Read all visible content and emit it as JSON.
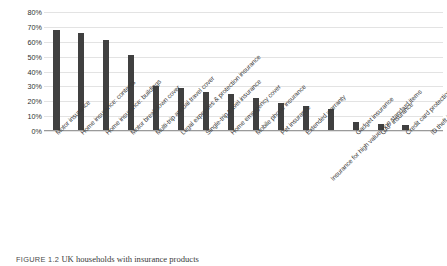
{
  "caption": {
    "number": "FIGURE 1.2",
    "text": "UK households with insurance products"
  },
  "chart_data": {
    "type": "bar",
    "title": "",
    "xlabel": "",
    "ylabel": "Percentage of UK households",
    "ylim": [
      0,
      80
    ],
    "ytick_labels": [
      "0%",
      "10%",
      "20%",
      "30%",
      "40%",
      "50%",
      "60%",
      "70%",
      "80%"
    ],
    "ytick_values": [
      0,
      10,
      20,
      30,
      40,
      50,
      60,
      70,
      80
    ],
    "grid": true,
    "legend": "none",
    "bar_color": "#404040",
    "categories": [
      "Motor insurance",
      "Home insurance: contents",
      "Home insurance: buildings",
      "Motor breakdown cover",
      "Multi-trip annual travel cover",
      "Legal expenses & protection insurance",
      "Single-trip travel insurance",
      "Home emergency cover",
      "Mobile phone insurance",
      "Pet insurance",
      "Extended warranty",
      "Insurance for high value/ non standard items",
      "Gadget insurance",
      "GAP insurance",
      "Credit card protection",
      "ID theft insurance"
    ],
    "values": [
      68,
      66,
      61,
      51,
      30,
      29,
      26,
      25,
      22,
      19,
      17,
      15,
      6,
      5,
      4,
      1
    ],
    "value_unit": "%"
  }
}
